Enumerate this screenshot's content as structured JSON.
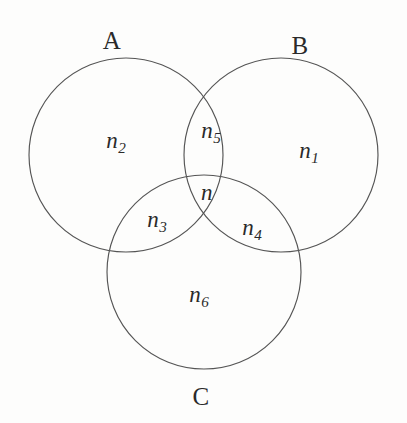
{
  "figure": {
    "type": "venn-diagram-3-set",
    "background_color": "#fdfdfc",
    "stroke_color": "#555555",
    "text_color": "#2a2a2a",
    "width": 407,
    "height": 423,
    "set_labels": [
      {
        "key": "A",
        "text": "A",
        "x": 112,
        "y": 40
      },
      {
        "key": "B",
        "text": "B",
        "x": 300,
        "y": 45
      },
      {
        "key": "C",
        "text": "C",
        "x": 201,
        "y": 396
      }
    ],
    "circles": [
      {
        "key": "A",
        "cx": 126,
        "cy": 155,
        "r": 97
      },
      {
        "key": "B",
        "cx": 281,
        "cy": 155,
        "r": 97
      },
      {
        "key": "C",
        "cx": 204,
        "cy": 272,
        "r": 97
      }
    ],
    "region_labels": [
      {
        "key": "n2",
        "base": "n",
        "sub": "2",
        "region": "A only",
        "x": 116,
        "y": 142
      },
      {
        "key": "n5",
        "base": "n",
        "sub": "5",
        "region": "A and B only",
        "x": 211,
        "y": 132
      },
      {
        "key": "n1",
        "base": "n",
        "sub": "1",
        "region": "B only",
        "x": 309,
        "y": 152
      },
      {
        "key": "n",
        "base": "n",
        "sub": "",
        "region": "A and B and C",
        "x": 207,
        "y": 194
      },
      {
        "key": "n3",
        "base": "n",
        "sub": "3",
        "region": "A and C only",
        "x": 157,
        "y": 221
      },
      {
        "key": "n4",
        "base": "n",
        "sub": "4",
        "region": "B and C only",
        "x": 252,
        "y": 229
      },
      {
        "key": "n6",
        "base": "n",
        "sub": "6",
        "region": "C only",
        "x": 199,
        "y": 296
      }
    ]
  }
}
